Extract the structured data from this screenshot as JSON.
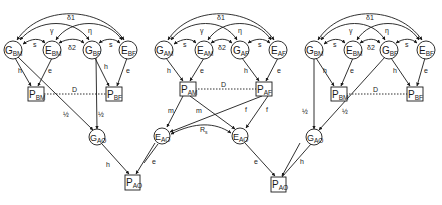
{
  "figure": {
    "colors": {
      "ink": "#1a1a1a",
      "background": "#ffffff"
    }
  },
  "panels": [
    {
      "id": "left",
      "nodes": {
        "g_bm": {
          "main": "G",
          "sub": "BM"
        },
        "e_bm": {
          "main": "E",
          "sub": "BM"
        },
        "g_bf": {
          "main": "G",
          "sub": "BF"
        },
        "e_bf": {
          "main": "E",
          "sub": "BF"
        },
        "p_bm": {
          "main": "P",
          "sub": "BM"
        },
        "p_bf": {
          "main": "P",
          "sub": "BF"
        },
        "g_ao": {
          "main": "G",
          "sub": "AO"
        },
        "p_ao": {
          "main": "P",
          "sub": "AO"
        }
      },
      "paths": {
        "delta1": "δ1",
        "gamma": "γ",
        "eta": "η",
        "s_left": "s",
        "delta2": "δ2",
        "s_right": "s",
        "h_m": "h",
        "e_m": "e",
        "h_f": "h",
        "e_f": "e",
        "d": "D",
        "half_m": "½",
        "half_f": "½",
        "h_o": "h"
      }
    },
    {
      "id": "middle",
      "nodes": {
        "g_am": {
          "main": "G",
          "sub": "AM"
        },
        "e_am": {
          "main": "E",
          "sub": "AM"
        },
        "g_af": {
          "main": "G",
          "sub": "AF"
        },
        "e_af": {
          "main": "E",
          "sub": "AF"
        },
        "p_am": {
          "main": "P",
          "sub": "AM"
        },
        "p_af": {
          "main": "P",
          "sub": "AF"
        },
        "e_ao1": {
          "main": "E",
          "sub": "AO"
        },
        "e_ao2": {
          "main": "E",
          "sub": "AO"
        },
        "p_ao": {
          "main": "P",
          "sub": "AO"
        }
      },
      "paths": {
        "delta1": "δ1",
        "gamma": "γ",
        "eta": "η",
        "s_left": "s",
        "delta2": "δ2",
        "s_right": "s",
        "h_m": "h",
        "e_m": "e",
        "h_f": "h",
        "e_f": "e",
        "d": "D",
        "m1": "m",
        "m2": "m",
        "f1": "f",
        "f2": "f",
        "rs_main": "R",
        "rs_sub": "s",
        "e_left": "e",
        "e_right": "e"
      }
    },
    {
      "id": "right",
      "nodes": {
        "g_bm": {
          "main": "G",
          "sub": "BM"
        },
        "e_bm": {
          "main": "E",
          "sub": "BM"
        },
        "g_bf": {
          "main": "G",
          "sub": "BF"
        },
        "e_bf": {
          "main": "E",
          "sub": "BF"
        },
        "p_bm": {
          "main": "P",
          "sub": "BM"
        },
        "p_bf": {
          "main": "P",
          "sub": "BF"
        },
        "g_ao": {
          "main": "G",
          "sub": "AO"
        }
      },
      "paths": {
        "delta1": "δ1",
        "gamma": "γ",
        "eta": "η",
        "s_left": "s",
        "delta2": "δ2",
        "s_right": "s",
        "h_m": "h",
        "e_m": "e",
        "h_f": "h",
        "e_f": "e",
        "d": "D",
        "half_m": "½",
        "half_f": "½",
        "h_o": "h"
      }
    }
  ]
}
